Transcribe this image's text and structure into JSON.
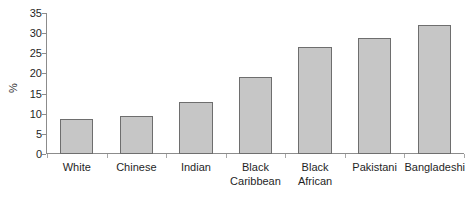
{
  "chart_data": {
    "type": "bar",
    "title": "",
    "subtitle": "",
    "xlabel": "",
    "ylabel": "%",
    "categories": [
      "White",
      "Chinese",
      "Indian",
      "Black Caribbean",
      "Black African",
      "Pakistani",
      "Bangladeshi"
    ],
    "category_lines": [
      [
        "White"
      ],
      [
        "Chinese"
      ],
      [
        "Indian"
      ],
      [
        "Black",
        "Caribbean"
      ],
      [
        "Black",
        "African"
      ],
      [
        "Pakistani"
      ],
      [
        "Bangladeshi"
      ]
    ],
    "values": [
      8.7,
      9.4,
      12.8,
      19.0,
      26.5,
      28.8,
      32.0
    ],
    "ylim": [
      0,
      35
    ],
    "ytick_labels": [
      "35",
      "30",
      "25",
      "20",
      "15",
      "10",
      "5",
      "0"
    ],
    "ytick_values": [
      35,
      30,
      25,
      20,
      15,
      10,
      5,
      0
    ],
    "ytick_step": 5,
    "grid": false,
    "legend": "none",
    "bar_fill_color": "#c6c6c6",
    "bar_edge_color": "#6e6e6e",
    "axis_color": "#8c8c8c",
    "text_color": "#1f1f1f",
    "background_color": "#ffffff"
  }
}
